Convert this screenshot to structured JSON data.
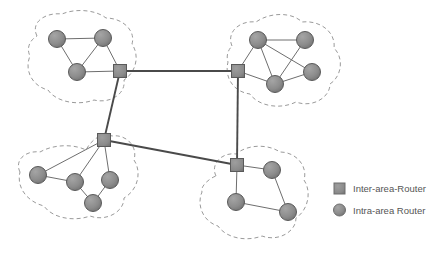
{
  "figure": {
    "background_color": "#ffffff"
  },
  "style": {
    "node_fill": "#8c8c8c",
    "node_stroke": "#5a5a5a",
    "router_fill": "#8c8c8c",
    "router_stroke": "#5a5a5a",
    "intra_link_color": "#6e6e6e",
    "backbone_link_color": "#4a4a4a",
    "area_boundary_color": "#9a9a9a",
    "legend_text_color": "#555555"
  },
  "legend": {
    "items": [
      {
        "shape": "square",
        "icon": "inter-area-router-icon",
        "label": "Inter-area-Router"
      },
      {
        "shape": "circle",
        "icon": "intra-area-router-icon",
        "label": "Intra-area Router"
      }
    ]
  },
  "areas": [
    {
      "id": "area-top-left",
      "name": "Top Left Area",
      "boundary": "M 37,36 C 30,22 46,12 62,14 C 76,8 96,10 106,18 C 122,18 136,30 132,44 C 140,56 136,72 124,80 C 126,94 110,104 94,100 C 78,106 56,102 48,90 C 32,86 24,70 30,56 C 26,48 30,40 37,36 Z",
      "inter_area_router": {
        "id": "R1",
        "x": 120,
        "y": 71,
        "size": 13
      },
      "intra_routers": [
        {
          "id": "A1",
          "x": 57,
          "y": 39,
          "r": 8.5
        },
        {
          "id": "A2",
          "x": 103,
          "y": 38,
          "r": 8.5
        },
        {
          "id": "A3",
          "x": 77,
          "y": 72,
          "r": 8.5
        }
      ],
      "intra_links": [
        [
          "A1",
          "A2"
        ],
        [
          "A1",
          "A3"
        ],
        [
          "A2",
          "A3"
        ],
        [
          "A2",
          "R1"
        ],
        [
          "A3",
          "R1"
        ]
      ]
    },
    {
      "id": "area-top-right",
      "name": "Top Right Area",
      "boundary": "M 232,46 C 226,32 240,20 256,22 C 270,12 292,12 302,22 C 320,20 336,32 334,48 C 344,58 342,76 330,84 C 330,98 312,108 296,102 C 280,110 258,106 250,94 C 234,92 224,78 228,62 C 226,56 228,50 232,46 Z",
      "inter_area_router": {
        "id": "R2",
        "x": 238,
        "y": 71,
        "size": 13
      },
      "intra_routers": [
        {
          "id": "B1",
          "x": 258,
          "y": 40,
          "r": 8.5
        },
        {
          "id": "B2",
          "x": 305,
          "y": 40,
          "r": 8.5
        },
        {
          "id": "B3",
          "x": 312,
          "y": 72,
          "r": 8.5
        },
        {
          "id": "B4",
          "x": 275,
          "y": 84,
          "r": 8.5
        }
      ],
      "intra_links": [
        [
          "B1",
          "B2"
        ],
        [
          "B1",
          "B3"
        ],
        [
          "B1",
          "B4"
        ],
        [
          "B2",
          "B4"
        ],
        [
          "B3",
          "B4"
        ],
        [
          "B1",
          "R2"
        ],
        [
          "B4",
          "R2"
        ]
      ]
    },
    {
      "id": "area-bottom-left",
      "name": "Bottom Left Area",
      "boundary": "M 20,172 C 14,160 26,150 40,152 C 54,144 74,144 86,150 C 92,138 104,132 112,136 C 126,134 138,146 134,160 C 142,172 138,190 124,198 C 124,212 106,222 90,216 C 74,222 52,218 44,206 C 28,202 16,188 20,172 Z",
      "inter_area_router": {
        "id": "R3",
        "x": 104,
        "y": 140,
        "size": 13
      },
      "intra_routers": [
        {
          "id": "C1",
          "x": 38,
          "y": 175,
          "r": 8.5
        },
        {
          "id": "C2",
          "x": 75,
          "y": 182,
          "r": 8.5
        },
        {
          "id": "C3",
          "x": 110,
          "y": 180,
          "r": 8.5
        },
        {
          "id": "C4",
          "x": 93,
          "y": 203,
          "r": 8.5
        }
      ],
      "intra_links": [
        [
          "C1",
          "C2"
        ],
        [
          "C2",
          "C4"
        ],
        [
          "C3",
          "C4"
        ],
        [
          "C1",
          "R3"
        ],
        [
          "C2",
          "R3"
        ],
        [
          "C3",
          "R3"
        ]
      ]
    },
    {
      "id": "area-bottom-right",
      "name": "Bottom Right Area",
      "boundary": "M 216,176 C 210,164 222,152 236,154 C 248,144 268,144 280,152 C 296,152 308,166 304,180 C 312,192 308,210 296,218 C 296,232 278,242 262,236 C 246,242 226,238 218,226 C 204,222 196,206 202,192 C 200,186 210,178 216,176 Z",
      "inter_area_router": {
        "id": "R4",
        "x": 237,
        "y": 165,
        "size": 13
      },
      "intra_routers": [
        {
          "id": "D1",
          "x": 272,
          "y": 170,
          "r": 8.5
        },
        {
          "id": "D2",
          "x": 236,
          "y": 202,
          "r": 8.5
        },
        {
          "id": "D3",
          "x": 288,
          "y": 212,
          "r": 8.5
        }
      ],
      "intra_links": [
        [
          "D1",
          "D3"
        ],
        [
          "D2",
          "D3"
        ],
        [
          "D1",
          "R4"
        ],
        [
          "D2",
          "R4"
        ]
      ]
    }
  ],
  "backbone_links": [
    {
      "from": "R1",
      "to": "R2",
      "x1": 120,
      "y1": 71,
      "x2": 238,
      "y2": 71
    },
    {
      "from": "R1",
      "to": "R3",
      "x1": 120,
      "y1": 71,
      "x2": 104,
      "y2": 140
    },
    {
      "from": "R3",
      "to": "R4",
      "x1": 104,
      "y1": 140,
      "x2": 237,
      "y2": 165
    },
    {
      "from": "R2",
      "to": "R4",
      "x1": 238,
      "y1": 71,
      "x2": 237,
      "y2": 165
    }
  ],
  "legend_layout": {
    "square_icon": {
      "x": 334,
      "y": 183,
      "size": 11
    },
    "circle_icon": {
      "x": 339.5,
      "y": 210,
      "r": 6
    },
    "text_x": 353,
    "row1_y": 192,
    "row2_y": 214
  }
}
